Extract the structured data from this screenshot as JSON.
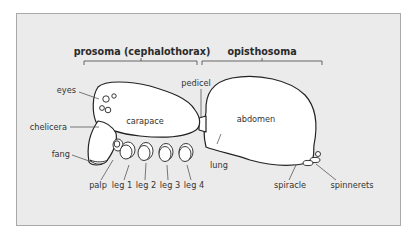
{
  "diagram": {
    "colors": {
      "panel_bg": "#ebebeb",
      "panel_border": "#a9a9a9",
      "body_fill": "#ffffff",
      "outline": "#222222",
      "label_text": "#333333"
    },
    "regions": {
      "prosoma": "prosoma (cephalothorax)",
      "opisthosoma": "opisthosoma"
    },
    "labels": {
      "eyes": "eyes",
      "chelicera": "chelicera",
      "fang": "fang",
      "carapace": "carapace",
      "pedicel": "pedicel",
      "abdomen": "abdomen",
      "lung": "lung",
      "palp": "palp",
      "leg1": "leg 1",
      "leg2": "leg 2",
      "leg3": "leg 3",
      "leg4": "leg 4",
      "spiracle": "spiracle",
      "spinnerets": "spinnerets"
    }
  }
}
